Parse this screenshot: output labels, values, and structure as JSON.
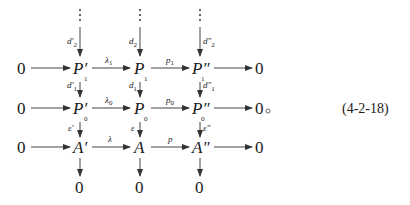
{
  "diagram": {
    "type": "commutative-diagram",
    "equation_number": "(4-2-18)",
    "nodes": {
      "top_dots": [
        "⋮",
        "⋮",
        "⋮"
      ],
      "row1": {
        "left_zero": "0",
        "a": "P′₁",
        "b": "P₁",
        "c": "P″₁",
        "right_zero": "0"
      },
      "row2": {
        "left_zero": "0",
        "a": "P′₀",
        "b": "P₀",
        "c": "P″₀",
        "right_zero": "0◦"
      },
      "row3": {
        "left_zero": "0",
        "a": "A′",
        "b": "A",
        "c": "A″",
        "right_zero": "0"
      },
      "bottom": [
        "0",
        "0",
        "0"
      ]
    },
    "horizontal_arrows": {
      "row1": [
        "",
        "λ₁",
        "p₁",
        ""
      ],
      "row2": [
        "",
        "λ₀",
        "p₀",
        ""
      ],
      "row3": [
        "",
        "λ",
        "p",
        ""
      ]
    },
    "vertical_arrows": {
      "col_a": [
        "d′₂",
        "d′₁",
        "ε′",
        ""
      ],
      "col_b": [
        "d₂",
        "d₁",
        "ε",
        ""
      ],
      "col_c": [
        "d″₂",
        "d″₁",
        "ε″",
        ""
      ]
    },
    "colors": {
      "ink": "#1a1a1a",
      "arrow": "#444444",
      "background": "#ffffff"
    }
  }
}
